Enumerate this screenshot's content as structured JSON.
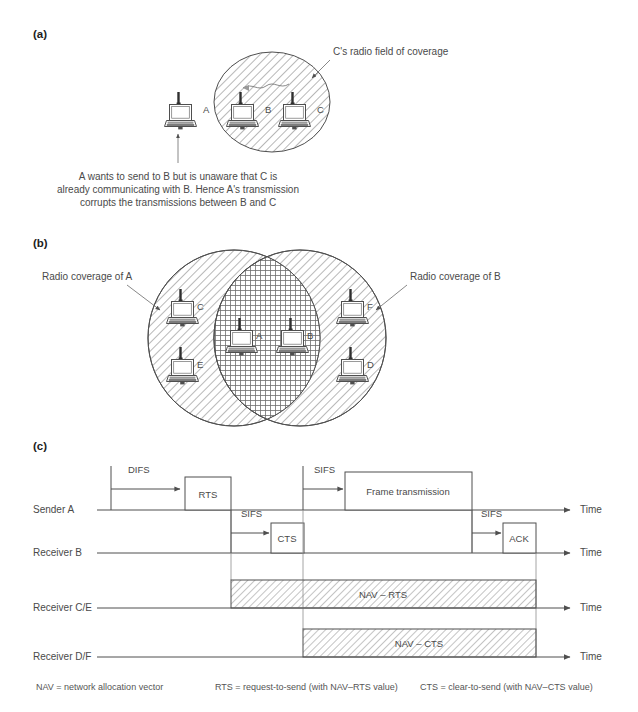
{
  "figure": {
    "panels": {
      "a": {
        "label": "(a)",
        "coverage_label": "C's radio field of coverage",
        "nodes": [
          {
            "id": "A",
            "label": "A"
          },
          {
            "id": "B",
            "label": "B"
          },
          {
            "id": "C",
            "label": "C"
          }
        ],
        "caption_lines": [
          "A wants to send to B but is unaware that C is",
          "already communicating with B. Hence A's transmission",
          "corrupts the transmissions between B and C"
        ]
      },
      "b": {
        "label": "(b)",
        "coverage_a_label": "Radio coverage of A",
        "coverage_b_label": "Radio coverage of B",
        "nodes": [
          {
            "id": "C",
            "label": "C"
          },
          {
            "id": "E",
            "label": "E"
          },
          {
            "id": "A",
            "label": "A"
          },
          {
            "id": "B",
            "label": "B"
          },
          {
            "id": "F",
            "label": "F"
          },
          {
            "id": "D",
            "label": "D"
          }
        ]
      },
      "c": {
        "label": "(c)",
        "rows": [
          {
            "id": "sender-a",
            "label": "Sender A",
            "time_axis_label": "Time"
          },
          {
            "id": "receiver-b",
            "label": "Receiver B",
            "time_axis_label": "Time"
          },
          {
            "id": "receiver-ce",
            "label": "Receiver C/E",
            "time_axis_label": "Time"
          },
          {
            "id": "receiver-df",
            "label": "Receiver D/F",
            "time_axis_label": "Time"
          }
        ],
        "intervals": [
          {
            "id": "difs-sender-a",
            "label": "DIFS"
          },
          {
            "id": "sifs-sender-a",
            "label": "SIFS"
          },
          {
            "id": "sifs-receiver-b-cts",
            "label": "SIFS"
          },
          {
            "id": "sifs-receiver-b-ack",
            "label": "SIFS"
          }
        ],
        "frames": [
          {
            "id": "rts",
            "label": "RTS"
          },
          {
            "id": "frame-transmission",
            "label": "Frame transmission"
          },
          {
            "id": "cts",
            "label": "CTS"
          },
          {
            "id": "ack",
            "label": "ACK"
          },
          {
            "id": "nav-rts",
            "label": "NAV – RTS"
          },
          {
            "id": "nav-cts",
            "label": "NAV – CTS"
          }
        ],
        "legend": [
          "NAV = network allocation vector",
          "RTS = request-to-send (with NAV–RTS value)",
          "CTS = clear-to-send (with NAV–CTS value)"
        ]
      }
    }
  },
  "colors": {
    "ink": "#4f4f4f",
    "text": "#4a4a4a",
    "hatch": "#7c7c7c",
    "background": "#ffffff"
  }
}
